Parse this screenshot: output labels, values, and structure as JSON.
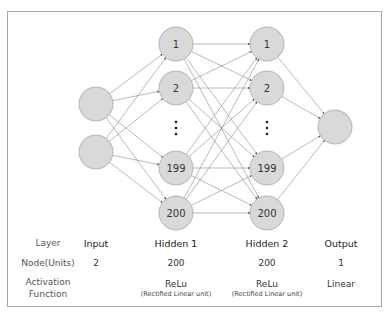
{
  "diagram": {
    "type": "neural-network",
    "colors": {
      "node_fill": "#d9d9d9",
      "node_stroke": "#a6a6a6",
      "edge": "#8c8c8c",
      "frame": "#a6a6a6"
    },
    "layers": [
      {
        "name": "Input",
        "nodes": [
          "",
          ""
        ]
      },
      {
        "name": "Hidden 1",
        "nodes": [
          "1",
          "2",
          "⋮",
          "199",
          "200"
        ]
      },
      {
        "name": "Hidden 2",
        "nodes": [
          "1",
          "2",
          "⋮",
          "199",
          "200"
        ]
      },
      {
        "name": "Output",
        "nodes": [
          ""
        ]
      }
    ],
    "ellipsis": "⋮"
  },
  "table": {
    "row_headers": {
      "layer": "Layer",
      "nodes": "Node(Units)",
      "activation_line1": "Activation",
      "activation_line2": "Function"
    },
    "columns": [
      {
        "layer": "Input",
        "nodes": "2",
        "activation": "",
        "activation_detail": ""
      },
      {
        "layer": "Hidden 1",
        "nodes": "200",
        "activation": "ReLu",
        "activation_detail": "(Rectified Linear unit)"
      },
      {
        "layer": "Hidden 2",
        "nodes": "200",
        "activation": "ReLu",
        "activation_detail": "(Rectified Linear unit)"
      },
      {
        "layer": "Output",
        "nodes": "1",
        "activation": "Linear",
        "activation_detail": ""
      }
    ]
  }
}
